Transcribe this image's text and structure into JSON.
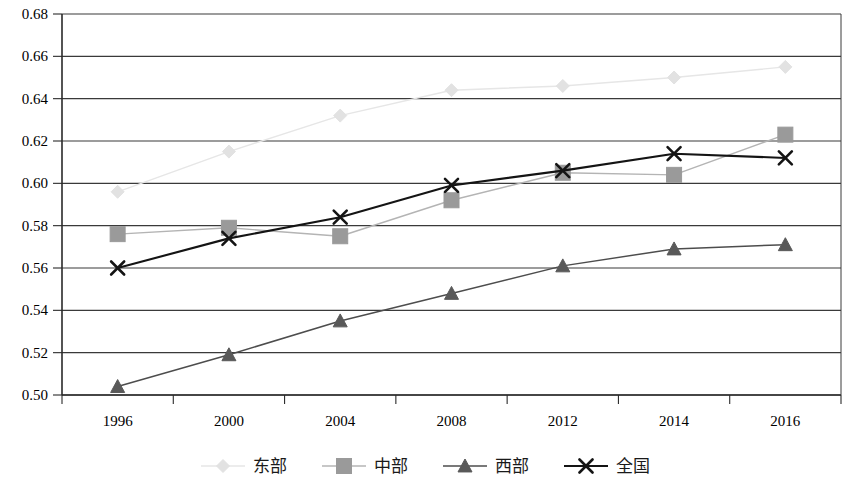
{
  "chart_data": {
    "type": "line",
    "title": "",
    "xlabel": "",
    "ylabel": "",
    "categories": [
      "1996",
      "2000",
      "2004",
      "2008",
      "2012",
      "2014",
      "2016"
    ],
    "ylim": [
      0.5,
      0.68
    ],
    "ytick_labels": [
      "0.68",
      "0.66",
      "0.64",
      "0.62",
      "0.60",
      "0.58",
      "0.56",
      "0.54",
      "0.52",
      "0.50"
    ],
    "ytick_values": [
      0.68,
      0.66,
      0.64,
      0.62,
      0.6,
      0.58,
      0.56,
      0.54,
      0.52,
      0.5
    ],
    "grid": true,
    "legend_position": "bottom",
    "series": [
      {
        "name": "东部",
        "marker": "diamond",
        "color": "#e2e2e2",
        "line_color": "#e6e6e6",
        "values": [
          0.596,
          0.615,
          0.632,
          0.644,
          0.646,
          0.65,
          0.655
        ]
      },
      {
        "name": "中部",
        "marker": "square",
        "color": "#9a9a9a",
        "line_color": "#b4b4b4",
        "values": [
          0.576,
          0.579,
          0.575,
          0.592,
          0.605,
          0.604,
          0.623
        ]
      },
      {
        "name": "西部",
        "marker": "triangle",
        "color": "#595959",
        "line_color": "#4d4d4d",
        "values": [
          0.504,
          0.519,
          0.535,
          0.548,
          0.561,
          0.569,
          0.571
        ]
      },
      {
        "name": "全国",
        "marker": "cross",
        "color": "#141414",
        "line_color": "#141414",
        "values": [
          0.56,
          0.574,
          0.584,
          0.599,
          0.606,
          0.614,
          0.612
        ]
      }
    ]
  }
}
